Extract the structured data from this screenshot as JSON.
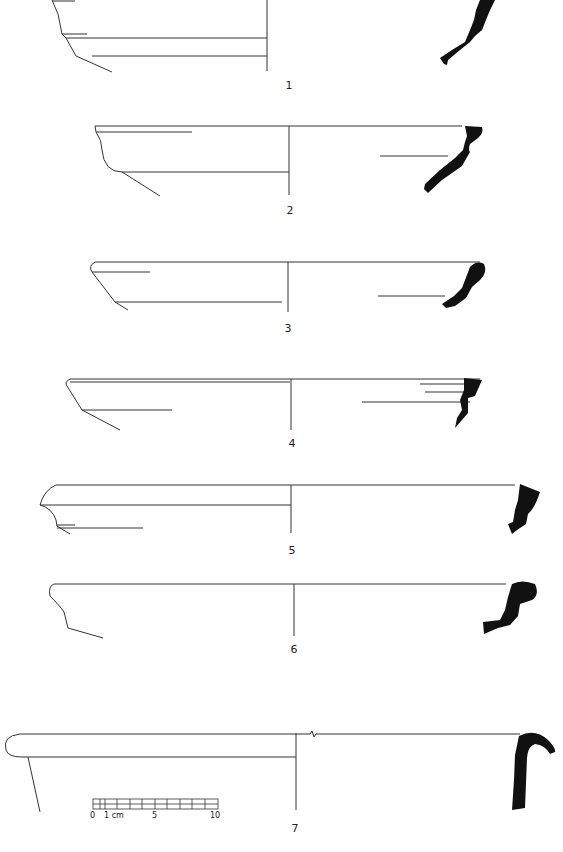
{
  "figure": {
    "profiles": [
      {
        "number": "1",
        "label_x": 289,
        "label_y": 79
      },
      {
        "number": "2",
        "label_x": 290,
        "label_y": 204
      },
      {
        "number": "3",
        "label_x": 288,
        "label_y": 322
      },
      {
        "number": "4",
        "label_x": 292,
        "label_y": 437
      },
      {
        "number": "5",
        "label_x": 292,
        "label_y": 544
      },
      {
        "number": "6",
        "label_x": 294,
        "label_y": 643
      },
      {
        "number": "7",
        "label_x": 295,
        "label_y": 822
      }
    ],
    "scale_bar": {
      "ticks": [
        "0",
        "1 cm",
        "5",
        "10"
      ],
      "unit": "cm"
    }
  }
}
